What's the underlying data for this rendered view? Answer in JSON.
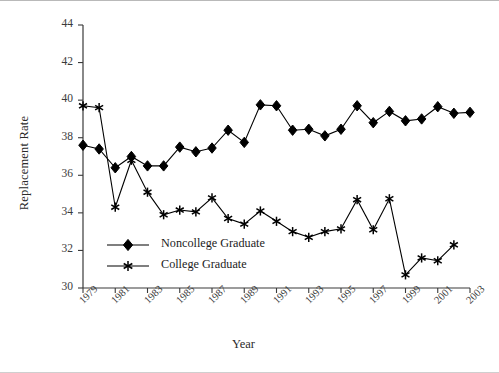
{
  "chart_data": {
    "type": "line",
    "title": "",
    "xlabel": "Year",
    "ylabel": "Replacement Rate",
    "xlim": [
      1979,
      2003
    ],
    "ylim": [
      30,
      44
    ],
    "ytick_step": 2,
    "xtick_step": 2,
    "grid": false,
    "legend_position": "inside-lower-left",
    "yticks": [
      "30",
      "32",
      "34",
      "36",
      "38",
      "40",
      "42",
      "44"
    ],
    "xticks": [
      "1979",
      "1981",
      "1983",
      "1985",
      "1987",
      "1989",
      "1991",
      "1993",
      "1995",
      "1997",
      "1999",
      "2001",
      "2003"
    ],
    "x": [
      1979,
      1980,
      1981,
      1982,
      1983,
      1984,
      1985,
      1986,
      1987,
      1988,
      1989,
      1990,
      1991,
      1992,
      1993,
      1994,
      1995,
      1996,
      1997,
      1998,
      1999,
      2000,
      2001,
      2002,
      2003
    ],
    "series": [
      {
        "name": "Noncollege Graduate",
        "marker": "diamond",
        "color": "#000000",
        "values": [
          37.6,
          37.4,
          36.4,
          37.0,
          36.5,
          36.5,
          37.5,
          37.25,
          37.45,
          38.4,
          37.75,
          39.75,
          39.7,
          38.4,
          38.45,
          38.1,
          38.45,
          39.7,
          38.8,
          39.4,
          38.9,
          39.0,
          39.65,
          39.3,
          39.35
        ]
      },
      {
        "name": "College Graduate",
        "marker": "asterisk",
        "color": "#000000",
        "values": [
          39.7,
          39.6,
          34.3,
          36.8,
          35.1,
          33.9,
          34.15,
          34.05,
          34.8,
          33.7,
          33.4,
          34.1,
          33.55,
          33.0,
          32.7,
          33.0,
          33.15,
          34.7,
          33.1,
          34.75,
          30.7,
          31.6,
          31.45,
          32.3,
          null
        ]
      }
    ]
  },
  "legend": {
    "items": [
      {
        "label": "Noncollege Graduate",
        "marker": "diamond"
      },
      {
        "label": "College Graduate",
        "marker": "asterisk"
      }
    ]
  }
}
